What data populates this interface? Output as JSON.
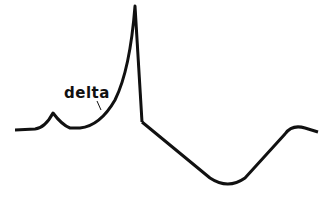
{
  "diagram": {
    "type": "waveform",
    "labels": [
      {
        "text": "delta",
        "x": 64,
        "y": 84
      }
    ],
    "colors": {
      "stroke": "#111111",
      "background": "#ffffff"
    }
  }
}
